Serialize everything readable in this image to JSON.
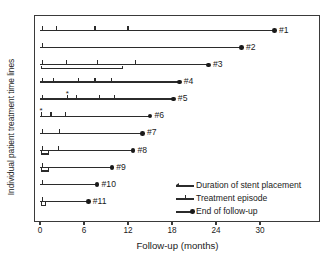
{
  "chart_data": {
    "type": "table",
    "title": "",
    "xlabel": "Follow-up (months)",
    "ylabel": "Individual patient treatment time lines",
    "xlim": [
      -0.7,
      38.0
    ],
    "xticks": [
      0,
      6,
      12,
      18,
      24,
      30
    ],
    "xticklabels": [
      "0",
      "6",
      "12",
      "18",
      "24",
      "30"
    ],
    "grid": false,
    "legend_position": "inside-bottom-right",
    "legend": [
      {
        "marker": "arrow-line",
        "label": "Duration of stent placement"
      },
      {
        "marker": "tick-line",
        "label": "Treatment episode"
      },
      {
        "marker": "dot-line",
        "label": "End of follow-up"
      }
    ],
    "units": "months",
    "series_note": "Each row is one patient: a follow-up line from month 0 to the end-of-follow-up dot, with vertical ticks marking treatment episodes, an optional lower bar marking duration of stent placement, and an optional asterisk annotation.",
    "patients": [
      {
        "label": "#1",
        "start": 0,
        "end_of_followup": 32.0,
        "treatment_episodes": [
          0.3,
          2.2,
          7.5,
          12.0
        ],
        "stent_placement": null,
        "asterisk": null
      },
      {
        "label": "#2",
        "start": 0,
        "end_of_followup": 27.5,
        "treatment_episodes": [
          0.3
        ],
        "stent_placement": null,
        "asterisk": null
      },
      {
        "label": "#3",
        "start": 0,
        "end_of_followup": 23.0,
        "treatment_episodes": [
          0.3,
          3.6,
          7.8,
          13.0
        ],
        "stent_placement": [
          0.2,
          11.2
        ],
        "asterisk": null
      },
      {
        "label": "#4",
        "start": 0,
        "end_of_followup": 19.0,
        "treatment_episodes": [
          0.3,
          1.9,
          5.3,
          7.5,
          9.8
        ],
        "stent_placement": null,
        "asterisk": null
      },
      {
        "label": "#5",
        "start": 0,
        "end_of_followup": 18.2,
        "treatment_episodes": [
          0.3,
          3.8,
          5.0,
          8.1,
          10.1
        ],
        "stent_placement": null,
        "asterisk": 3.8
      },
      {
        "label": "#6",
        "start": 0,
        "end_of_followup": 15.0,
        "treatment_episodes": [
          0.2,
          1.5,
          3.5
        ],
        "stent_placement": null,
        "asterisk": 0.2
      },
      {
        "label": "#7",
        "start": 0,
        "end_of_followup": 14.0,
        "treatment_episodes": [
          0.3,
          2.7
        ],
        "stent_placement": null,
        "asterisk": null
      },
      {
        "label": "#8",
        "start": 0,
        "end_of_followup": 12.7,
        "treatment_episodes": [
          0.3,
          2.5
        ],
        "stent_placement": [
          0.2,
          1.1
        ],
        "asterisk": null
      },
      {
        "label": "#9",
        "start": 0,
        "end_of_followup": 9.8,
        "treatment_episodes": [
          0.3
        ],
        "stent_placement": [
          0.2,
          1.1
        ],
        "asterisk": null
      },
      {
        "label": "#10",
        "start": 0,
        "end_of_followup": 7.8,
        "treatment_episodes": [
          0.3
        ],
        "stent_placement": null,
        "asterisk": null
      },
      {
        "label": "#11",
        "start": 0,
        "end_of_followup": 6.6,
        "treatment_episodes": [
          0.3
        ],
        "stent_placement": [
          0.2,
          0.8
        ],
        "asterisk": null
      }
    ]
  }
}
